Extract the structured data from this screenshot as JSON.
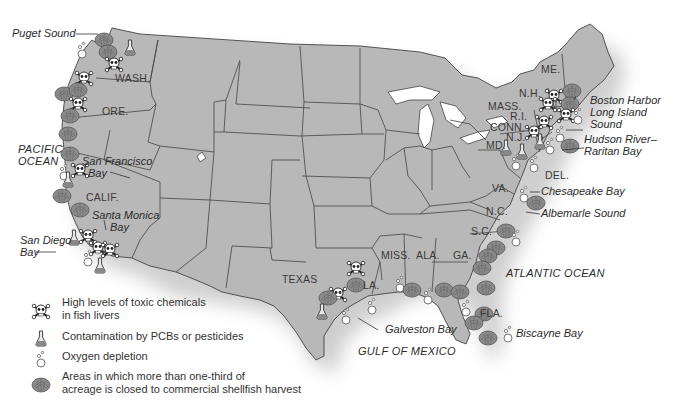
{
  "map": {
    "title": "",
    "colors": {
      "land": "#b9b9b9",
      "land_shadow": "#9a9a9a",
      "state_border": "#4a4a4a",
      "shell": "#8e8e8e",
      "water_text": "#2b2b2b",
      "background": "#ffffff"
    },
    "oceans": [
      {
        "id": "pacific",
        "line1": "PACIFIC",
        "line2": "OCEAN"
      },
      {
        "id": "atlantic",
        "label": "ATLANTIC OCEAN"
      },
      {
        "id": "gulf",
        "label": "GULF OF MEXICO"
      }
    ],
    "states": [
      {
        "id": "wash",
        "label": "WASH."
      },
      {
        "id": "ore",
        "label": "ORE."
      },
      {
        "id": "calif",
        "label": "CALIF."
      },
      {
        "id": "texas",
        "label": "TEXAS"
      },
      {
        "id": "la",
        "label": "LA."
      },
      {
        "id": "miss",
        "label": "MISS."
      },
      {
        "id": "ala",
        "label": "ALA."
      },
      {
        "id": "ga",
        "label": "GA."
      },
      {
        "id": "fla",
        "label": "FLA."
      },
      {
        "id": "sc",
        "label": "S.C."
      },
      {
        "id": "nc",
        "label": "N.C."
      },
      {
        "id": "va",
        "label": "VA."
      },
      {
        "id": "md",
        "label": "MD."
      },
      {
        "id": "del",
        "label": "DEL."
      },
      {
        "id": "nj",
        "label": "N.J."
      },
      {
        "id": "conn",
        "label": "CONN."
      },
      {
        "id": "ri",
        "label": "R.I."
      },
      {
        "id": "mass",
        "label": "MASS."
      },
      {
        "id": "nh",
        "label": "N.H."
      },
      {
        "id": "me",
        "label": "ME."
      }
    ],
    "water_bodies": [
      {
        "id": "puget",
        "label": "Puget Sound"
      },
      {
        "id": "sf1",
        "label": "San Francisco"
      },
      {
        "id": "sf2",
        "label": "Bay"
      },
      {
        "id": "sm1",
        "label": "Santa Monica"
      },
      {
        "id": "sm2",
        "label": "Bay"
      },
      {
        "id": "sd1",
        "label": "San Diego"
      },
      {
        "id": "sd2",
        "label": "Bay"
      },
      {
        "id": "galveston",
        "label": "Galveston Bay"
      },
      {
        "id": "biscayne",
        "label": "Biscayne Bay"
      },
      {
        "id": "albemarle",
        "label": "Albemarle Sound"
      },
      {
        "id": "chesapeake",
        "label": "Chesapeake Bay"
      },
      {
        "id": "hudson1",
        "label": "Hudson River–"
      },
      {
        "id": "hudson2",
        "label": "Raritan Bay"
      },
      {
        "id": "li1",
        "label": "Long Island"
      },
      {
        "id": "li2",
        "label": "Sound"
      },
      {
        "id": "boston",
        "label": "Boston Harbor"
      }
    ]
  },
  "legend": {
    "items": [
      {
        "icon": "skull-crossbones-icon",
        "line1": "High levels of toxic chemicals",
        "line2": "in fish livers"
      },
      {
        "icon": "flask-icon",
        "line1": "Contamination by PCBs or pesticides"
      },
      {
        "icon": "bubbles-icon",
        "line1": "Oxygen depletion"
      },
      {
        "icon": "shellfish-icon",
        "line1": "Areas in which more than one-third of",
        "line2": "acreage is closed to commercial shellfish harvest"
      }
    ]
  }
}
